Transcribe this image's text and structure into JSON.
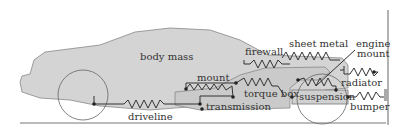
{
  "diagram": {
    "labels": {
      "body_mass": "body mass",
      "firewall": "firewall",
      "sheet_metal": "sheet metal",
      "engine_mount_1": "engine",
      "engine_mount_2": "mount",
      "mount": "mount",
      "radiator": "radiator",
      "torque_box": "torque box",
      "suspension": "suspension",
      "transmission": "transmission",
      "bumper": "bumper",
      "driveline": "driveline"
    },
    "colors": {
      "body_fill": "#d4d4d4",
      "line": "#444444",
      "background": "#ffffff"
    }
  }
}
